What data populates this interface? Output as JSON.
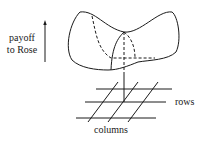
{
  "diagram": {
    "axis_label_line1": "payoff",
    "axis_label_line2": "to Rose",
    "grid_label_rows": "rows",
    "grid_label_columns": "columns",
    "ink_color": "#1a1a1a"
  }
}
